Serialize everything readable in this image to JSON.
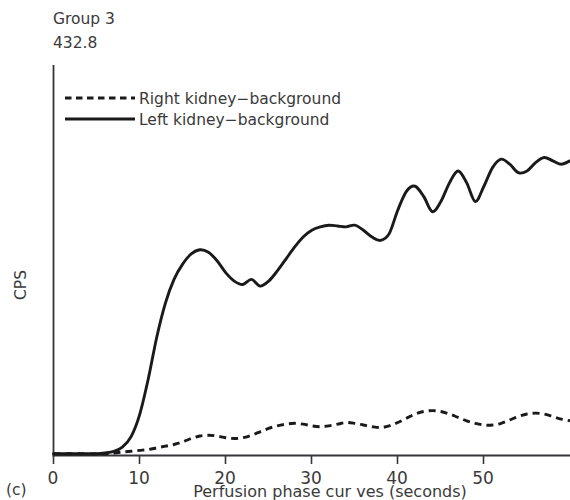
{
  "figure": {
    "panel_label": "(c)",
    "group_title": "Group 3",
    "group_value": "432.8"
  },
  "chart_data": {
    "type": "line",
    "title": "Group 3",
    "annotation": "432.8",
    "panel": "(c)",
    "xlabel": "Perfusion phase cur ves (seconds)",
    "ylabel": "CPS",
    "xlim": [
      0,
      60
    ],
    "ylim": [
      0,
      460
    ],
    "xticks": [
      0,
      10,
      20,
      30,
      40,
      50
    ],
    "xtick_labels": [
      "0",
      "10",
      "20",
      "30",
      "40",
      "50"
    ],
    "yticks": [],
    "ytick_labels": [],
    "grid": false,
    "legend_position": "top-left",
    "series": [
      {
        "name": "Right kidney−background",
        "style": "dashed",
        "color": "#1a1a1a",
        "x": [
          0,
          1,
          2,
          3,
          4,
          5,
          6,
          7,
          8,
          9,
          10,
          11,
          12,
          13,
          14,
          15,
          16,
          17,
          18,
          19,
          20,
          21,
          22,
          23,
          24,
          25,
          26,
          27,
          28,
          29,
          30,
          31,
          32,
          33,
          34,
          35,
          36,
          37,
          38,
          39,
          40,
          41,
          42,
          43,
          44,
          45,
          46,
          47,
          48,
          49,
          50,
          51,
          52,
          53,
          54,
          55,
          56,
          57,
          58,
          59,
          60
        ],
        "y": [
          2,
          2,
          2,
          2,
          2,
          2,
          2,
          3,
          4,
          5,
          6,
          7,
          9,
          11,
          13,
          16,
          20,
          23,
          24,
          23,
          21,
          20,
          21,
          24,
          28,
          32,
          35,
          37,
          38,
          37,
          35,
          34,
          35,
          37,
          39,
          38,
          36,
          34,
          33,
          35,
          39,
          44,
          49,
          52,
          53,
          52,
          49,
          45,
          41,
          38,
          36,
          36,
          38,
          42,
          46,
          49,
          50,
          49,
          46,
          43,
          41
        ]
      },
      {
        "name": "Left kidney−background",
        "style": "solid",
        "color": "#1a1a1a",
        "x": [
          0,
          1,
          2,
          3,
          4,
          5,
          6,
          7,
          8,
          9,
          10,
          11,
          12,
          13,
          14,
          15,
          16,
          17,
          18,
          19,
          20,
          21,
          22,
          23,
          24,
          25,
          26,
          27,
          28,
          29,
          30,
          31,
          32,
          33,
          34,
          35,
          36,
          37,
          38,
          39,
          40,
          41,
          42,
          43,
          44,
          45,
          46,
          47,
          48,
          49,
          50,
          51,
          52,
          53,
          54,
          55,
          56,
          57,
          58,
          59,
          60
        ],
        "y": [
          2,
          2,
          2,
          2,
          2,
          2,
          3,
          5,
          10,
          22,
          48,
          90,
          140,
          180,
          208,
          226,
          238,
          243,
          240,
          230,
          216,
          206,
          202,
          208,
          200,
          206,
          218,
          232,
          246,
          258,
          266,
          270,
          272,
          271,
          270,
          272,
          266,
          258,
          254,
          262,
          290,
          312,
          318,
          306,
          288,
          300,
          322,
          336,
          322,
          300,
          318,
          340,
          350,
          344,
          334,
          336,
          346,
          352,
          348,
          344,
          348
        ]
      }
    ]
  },
  "legend": {
    "items": [
      {
        "label": "Right kidney−background",
        "style": "dashed"
      },
      {
        "label": "Left kidney−background",
        "style": "solid"
      }
    ]
  },
  "axes": {
    "x_title": "Perfusion phase cur ves (seconds)",
    "y_title": "CPS",
    "x_tick_labels": [
      "0",
      "10",
      "20",
      "30",
      "40",
      "50"
    ]
  }
}
